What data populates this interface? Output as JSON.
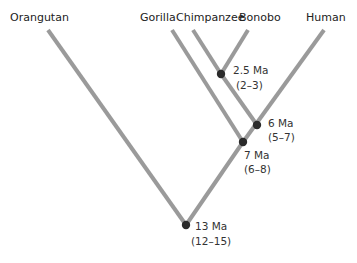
{
  "diagram": {
    "type": "phylogenetic-tree",
    "colors": {
      "branch": "#9a9a9a",
      "node": "#2a2a2a",
      "text": "#222222"
    },
    "taxa": [
      {
        "id": "orangutan",
        "label": "Orangutan"
      },
      {
        "id": "gorilla",
        "label": "Gorilla"
      },
      {
        "id": "chimpanzee",
        "label": "Chimpanzee"
      },
      {
        "id": "bonobo",
        "label": "Bonobo"
      },
      {
        "id": "human",
        "label": "Human"
      }
    ],
    "nodes": [
      {
        "id": "chimp-bonobo",
        "age": "2.5 Ma",
        "range": "(2–3)",
        "children": [
          "chimpanzee",
          "bonobo"
        ]
      },
      {
        "id": "pan-human",
        "age": "6 Ma",
        "range": "(5–7)",
        "children": [
          "chimp-bonobo",
          "human"
        ]
      },
      {
        "id": "gorilla-panhomo",
        "age": "7 Ma",
        "range": "(6–8)",
        "children": [
          "gorilla",
          "pan-human"
        ]
      },
      {
        "id": "root",
        "age": "13 Ma",
        "range": "(12–15)",
        "children": [
          "orangutan",
          "gorilla-panhomo"
        ]
      }
    ]
  }
}
